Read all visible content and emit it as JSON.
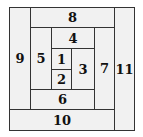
{
  "diagram": {
    "type": "nested-rectangle spiral (log cabin) layout",
    "regions": [
      {
        "label": "1",
        "x": 51,
        "y": 48,
        "w": 21,
        "h": 22
      },
      {
        "label": "2",
        "x": 51,
        "y": 69,
        "w": 21,
        "h": 21
      },
      {
        "label": "3",
        "x": 71,
        "y": 48,
        "w": 24,
        "h": 42
      },
      {
        "label": "4",
        "x": 51,
        "y": 27,
        "w": 44,
        "h": 22
      },
      {
        "label": "5",
        "x": 30,
        "y": 27,
        "w": 22,
        "h": 63
      },
      {
        "label": "6",
        "x": 30,
        "y": 89,
        "w": 65,
        "h": 21
      },
      {
        "label": "7",
        "x": 94,
        "y": 27,
        "w": 21,
        "h": 83
      },
      {
        "label": "8",
        "x": 30,
        "y": 7,
        "w": 85,
        "h": 21
      },
      {
        "label": "9",
        "x": 9,
        "y": 7,
        "w": 22,
        "h": 103
      },
      {
        "label": "10",
        "x": 9,
        "y": 109,
        "w": 106,
        "h": 22
      },
      {
        "label": "11",
        "x": 114,
        "y": 7,
        "w": 21,
        "h": 124
      }
    ]
  }
}
